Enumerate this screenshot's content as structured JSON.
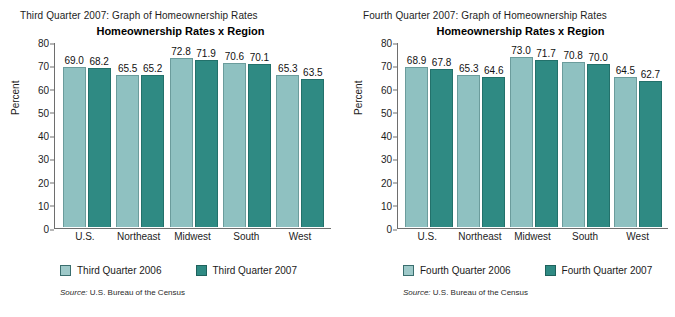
{
  "panels": [
    {
      "caption": "Third Quarter 2007: Graph of Homeownership Rates",
      "title": "Homeownership Rates x Region",
      "ylabel": "Percent",
      "source_keyword": "Source:",
      "source_text": "U.S. Bureau of the Census",
      "legend": [
        {
          "label": "Third Quarter 2006",
          "color": "#9ec9c9"
        },
        {
          "label": "Third Quarter 2007",
          "color": "#2f8a83"
        }
      ],
      "yticks": [
        "80",
        "70",
        "60",
        "50",
        "40",
        "30",
        "20",
        "10",
        "0"
      ],
      "categories": [
        "U.S.",
        "Northeast",
        "Midwest",
        "South",
        "West"
      ],
      "bars": [
        {
          "v1": "69.0",
          "v2": "68.2"
        },
        {
          "v1": "65.5",
          "v2": "65.2"
        },
        {
          "v1": "72.8",
          "v2": "71.9"
        },
        {
          "v1": "70.6",
          "v2": "70.1"
        },
        {
          "v1": "65.3",
          "v2": "63.5"
        }
      ]
    },
    {
      "caption": "Fourth Quarter 2007: Graph of Homeownership Rates",
      "title": "Homeownership Rates x Region",
      "ylabel": "Percent",
      "source_keyword": "Source:",
      "source_text": "U.S. Bureau of the Census",
      "legend": [
        {
          "label": "Fourth Quarter 2006",
          "color": "#9ec9c9"
        },
        {
          "label": "Fourth Quarter 2007",
          "color": "#2f8a83"
        }
      ],
      "yticks": [
        "80",
        "70",
        "60",
        "50",
        "40",
        "30",
        "20",
        "10",
        "0"
      ],
      "categories": [
        "U.S.",
        "Northeast",
        "Midwest",
        "South",
        "West"
      ],
      "bars": [
        {
          "v1": "68.9",
          "v2": "67.8"
        },
        {
          "v1": "65.3",
          "v2": "64.6"
        },
        {
          "v1": "73.0",
          "v2": "71.7"
        },
        {
          "v1": "70.8",
          "v2": "70.0"
        },
        {
          "v1": "64.5",
          "v2": "62.7"
        }
      ]
    }
  ],
  "chart_data": [
    {
      "type": "bar",
      "title": "Homeownership Rates x Region",
      "subtitle": "Third Quarter 2007: Graph of Homeownership Rates",
      "xlabel": "",
      "ylabel": "Percent",
      "ylim": [
        0,
        80
      ],
      "ytick_step": 10,
      "grid": false,
      "legend_position": "bottom",
      "categories": [
        "U.S.",
        "Northeast",
        "Midwest",
        "South",
        "West"
      ],
      "series": [
        {
          "name": "Third Quarter 2006",
          "color": "#9ec9c9",
          "values": [
            69.0,
            65.5,
            72.8,
            70.6,
            65.3
          ]
        },
        {
          "name": "Third Quarter 2007",
          "color": "#2f8a83",
          "values": [
            68.2,
            65.2,
            71.9,
            70.1,
            63.5
          ]
        }
      ],
      "annotation": "Source: U.S. Bureau of the Census"
    },
    {
      "type": "bar",
      "title": "Homeownership Rates x Region",
      "subtitle": "Fourth Quarter 2007: Graph of Homeownership Rates",
      "xlabel": "",
      "ylabel": "Percent",
      "ylim": [
        0,
        80
      ],
      "ytick_step": 10,
      "grid": false,
      "legend_position": "bottom",
      "categories": [
        "U.S.",
        "Northeast",
        "Midwest",
        "South",
        "West"
      ],
      "series": [
        {
          "name": "Fourth Quarter 2006",
          "color": "#9ec9c9",
          "values": [
            68.9,
            65.3,
            73.0,
            70.8,
            64.5
          ]
        },
        {
          "name": "Fourth Quarter 2007",
          "color": "#2f8a83",
          "values": [
            67.8,
            64.6,
            71.7,
            70.0,
            62.7
          ]
        }
      ],
      "annotation": "Source: U.S. Bureau of the Census"
    }
  ]
}
